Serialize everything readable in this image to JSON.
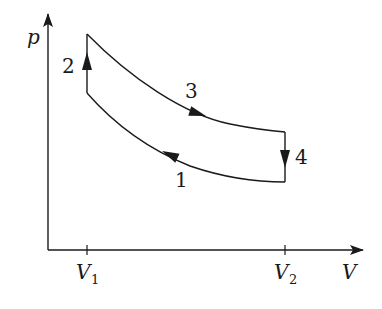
{
  "diagram": {
    "type": "pV-cycle",
    "axes": {
      "y_label": "p",
      "x_label": "V",
      "x_ticks": [
        {
          "label_main": "V",
          "label_sub": "1"
        },
        {
          "label_main": "V",
          "label_sub": "2"
        }
      ]
    },
    "processes": [
      {
        "id": "1",
        "label": "1",
        "description": "curve from V2 (low p) to V1, arrow pointing toward V1"
      },
      {
        "id": "2",
        "label": "2",
        "description": "vertical at V1, pressure increasing"
      },
      {
        "id": "3",
        "label": "3",
        "description": "curve from V1 (high p) to V2, arrow pointing toward V2"
      },
      {
        "id": "4",
        "label": "4",
        "description": "vertical at V2, pressure decreasing"
      }
    ],
    "colors": {
      "line": "#1a1a1a",
      "background": "#ffffff"
    }
  }
}
